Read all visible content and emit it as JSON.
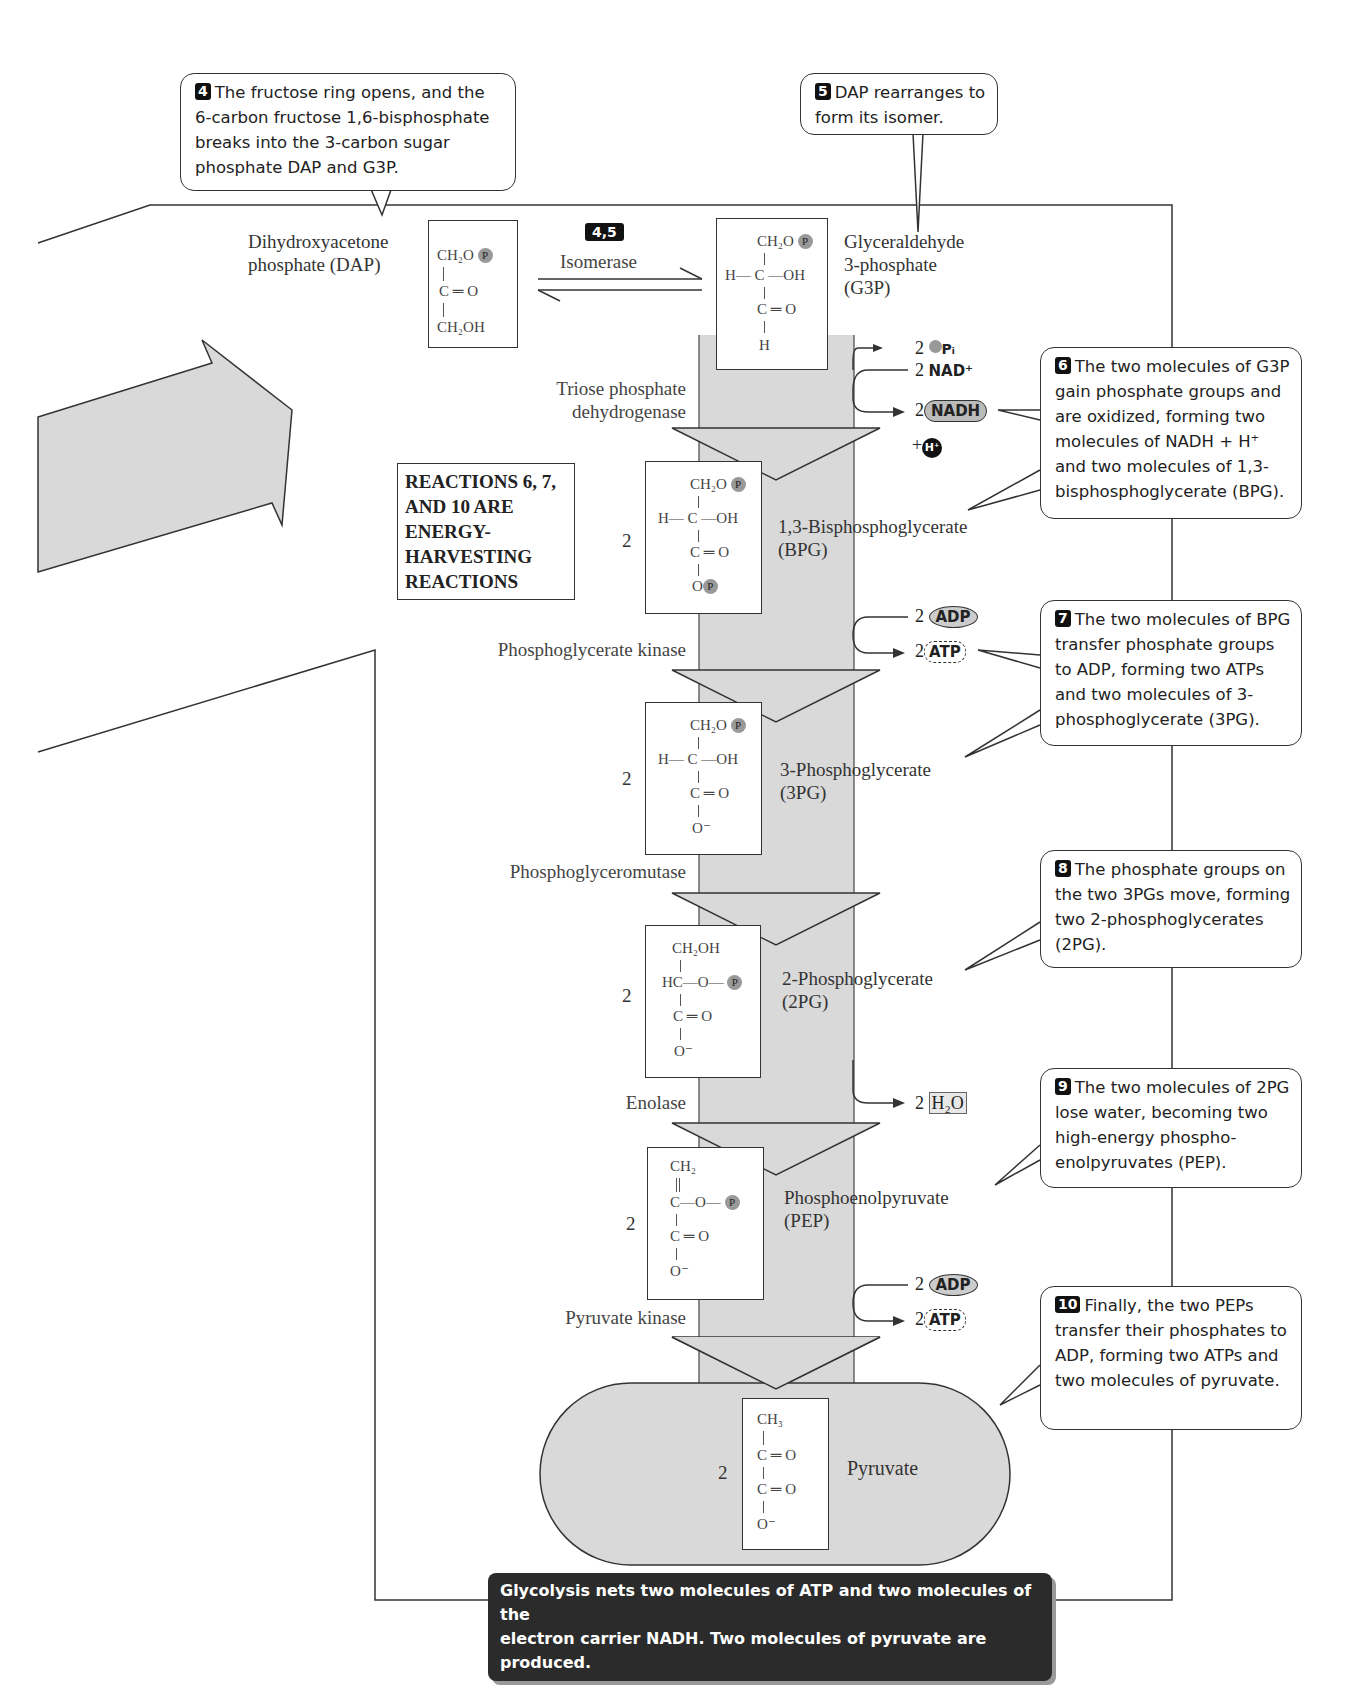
{
  "callouts": [
    {
      "step": "4",
      "text": "The fructose ring opens, and the 6-carbon fructose 1,6-bisphosphate breaks into the 3-carbon sugar phosphate  DAP and G3P."
    },
    {
      "step": "5",
      "text": "DAP rearranges to form its isomer."
    },
    {
      "step": "6",
      "text": "The two molecules of G3P gain phosphate groups and are oxidized, forming two molecules of  NADH + H⁺ and two  molecules of 1,3-bisphosphoglycerate (BPG)."
    },
    {
      "step": "7",
      "text": "The two molecules of BPG transfer phosphate groups to ADP, forming two ATPs and two molecules of 3-phosphoglycerate (3PG)."
    },
    {
      "step": "8",
      "text": "The phosphate groups on the two 3PGs move, forming two 2-phosphoglycerates (2PG)."
    },
    {
      "step": "9",
      "text": "The two molecules of 2PG lose water, becoming two high-energy phospho-enolpyruvates (PEP)."
    },
    {
      "step": "10",
      "text": "Finally, the two PEPs transfer their phosphates to ADP,  forming two ATPs and two molecules of pyruvate."
    }
  ],
  "molecules": {
    "dap": {
      "name_line1": "Dihydroxyacetone",
      "name_line2": "phosphate (DAP)",
      "l1": "CH₂O",
      "l2": "C ═ O",
      "l3": "CH₂OH"
    },
    "g3p": {
      "name_line1": "Glyceraldehyde",
      "name_line2": "3-phosphate",
      "name_line3": "(G3P)",
      "l1": "CH₂O",
      "l2": "H— C —OH",
      "l3": "C ═ O",
      "l4": "H"
    },
    "bpg": {
      "coef": "2",
      "name_line1": "1,3-Bisphosphoglycerate",
      "name_line2": "(BPG)",
      "l1": "CH₂O",
      "l2": "H— C —OH",
      "l3": "C ═ O",
      "l4": "O"
    },
    "pg3": {
      "coef": "2",
      "name_line1": "3-Phosphoglycerate",
      "name_line2": "(3PG)",
      "l1": "CH₂O",
      "l2": "H— C —OH",
      "l3": "C ═ O",
      "l4": "O⁻"
    },
    "pg2": {
      "coef": "2",
      "name_line1": "2-Phosphoglycerate",
      "name_line2": "(2PG)",
      "l1": "CH₂OH",
      "l2": "HC—O—",
      "l3": "C ═ O",
      "l4": "O⁻"
    },
    "pep": {
      "coef": "2",
      "name_line1": "Phosphoenolpyruvate",
      "name_line2": "(PEP)",
      "l1": "CH₂",
      "l2": "C—O—",
      "l3": "C ═ O",
      "l4": "O⁻"
    },
    "pyruvate": {
      "coef": "2",
      "name": "Pyruvate",
      "l1": "CH₃",
      "l2": "C ═ O",
      "l3": "C ═ O",
      "l4": "O⁻"
    }
  },
  "phosphate_symbol": "P",
  "enzymes": {
    "isomerase_badge": "4,5",
    "isomerase": "Isomerase",
    "tpd_line1": "Triose phosphate",
    "tpd_line2": "dehydrogenase",
    "pgk": "Phosphoglycerate kinase",
    "pgm": "Phosphoglyceromutase",
    "enolase": "Enolase",
    "pk": "Pyruvate kinase"
  },
  "side_products": {
    "step6": {
      "pi_coef": "2",
      "pi": "Pᵢ",
      "nad_coef": "2",
      "nad": "NAD⁺",
      "nadh_coef": "2",
      "nadh": "NADH",
      "h_prefix": "+",
      "h": "H⁺"
    },
    "step7": {
      "adp_coef": "2",
      "adp": "ADP",
      "atp_coef": "2",
      "atp": "ATP"
    },
    "step9": {
      "water_coef": "2",
      "water": "H₂O"
    },
    "step10": {
      "adp_coef": "2",
      "adp": "ADP",
      "atp_coef": "2",
      "atp": "ATP"
    }
  },
  "reactions_box": {
    "l1": "REACTIONS 6, 7,",
    "l2": "AND 10 ARE",
    "l3": "ENERGY-",
    "l4": "HARVESTING",
    "l5": "REACTIONS"
  },
  "summary": {
    "line1": "Glycolysis nets two molecules of ATP and two molecules of the",
    "line2": "electron carrier NADH. Two molecules of pyruvate are produced."
  },
  "colors": {
    "arrow_fill": "#d9d9d9",
    "line": "#333333",
    "banner_bg": "#2b2b2b",
    "badge_bg": "#111111"
  }
}
